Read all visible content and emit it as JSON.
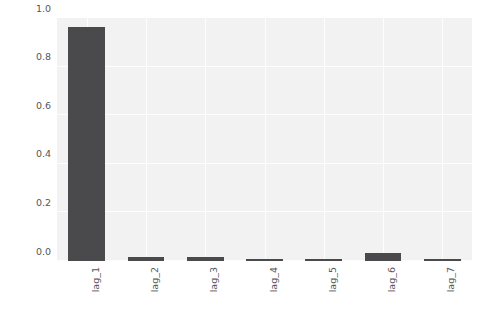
{
  "chart_data": {
    "type": "bar",
    "title": "",
    "subtitle": "",
    "xlabel": "",
    "ylabel": "",
    "categories": [
      "lag_1",
      "lag_2",
      "lag_3",
      "lag_4",
      "lag_5",
      "lag_6",
      "lag_7"
    ],
    "values": [
      0.962,
      0.015,
      0.016,
      0.007,
      0.008,
      0.031,
      0.004
    ],
    "series": [
      {
        "name": "importance",
        "values": [
          0.962,
          0.015,
          0.016,
          0.007,
          0.008,
          0.031,
          0.004
        ]
      }
    ],
    "ylim": [
      0.0,
      1.0
    ],
    "xlim": [
      0,
      7
    ],
    "yticks": [
      0.0,
      0.2,
      0.4,
      0.6,
      0.8,
      1.0
    ],
    "ytick_labels": [
      "0.0",
      "0.2",
      "0.4",
      "0.6",
      "0.8",
      "1.0"
    ],
    "xtick_labels": [
      "lag_1",
      "lag_2",
      "lag_3",
      "lag_4",
      "lag_5",
      "lag_6",
      "lag_7"
    ],
    "xtick_rotation": 90,
    "grid": true,
    "grid_axis": "both",
    "grid_color": "#ffffff",
    "legend": null,
    "legend_position": "none",
    "annotations": [],
    "bar_color": "#4a4a4d",
    "plot_background": "#f2f2f3",
    "figure_background": "#ffffff",
    "tick_label_color": "#555558"
  }
}
